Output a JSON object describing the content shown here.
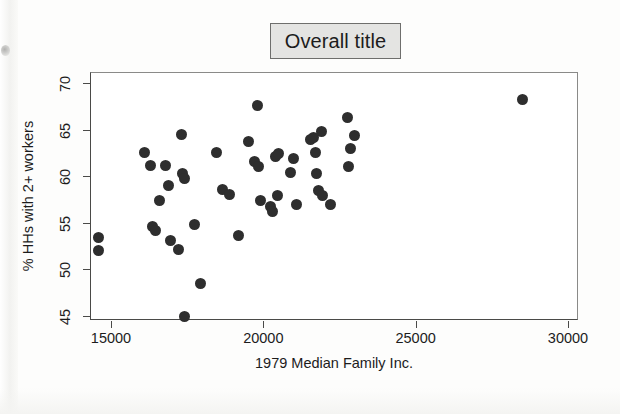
{
  "chart_data": {
    "type": "scatter",
    "title": "Overall title",
    "xlabel": "1979 Median Family Inc.",
    "ylabel": "% HHs with 2+ workers",
    "xlim": [
      14000,
      30400
    ],
    "ylim": [
      44.0,
      70.6
    ],
    "xticks": [
      15000,
      20000,
      25000,
      30000
    ],
    "xtick_labels": [
      "15000",
      "20000",
      "25000",
      "30000"
    ],
    "yticks": [
      45,
      50,
      55,
      60,
      65,
      70
    ],
    "ytick_labels": [
      "45",
      "50",
      "55",
      "60",
      "65",
      "70"
    ],
    "grid": false,
    "legend": null,
    "marker": "filled-circle",
    "marker_color": "#2e2e2e",
    "points": [
      {
        "x": 14600,
        "y": 53.4
      },
      {
        "x": 14600,
        "y": 52.0
      },
      {
        "x": 16100,
        "y": 62.5
      },
      {
        "x": 16300,
        "y": 61.1
      },
      {
        "x": 16350,
        "y": 54.6
      },
      {
        "x": 16450,
        "y": 54.2
      },
      {
        "x": 16600,
        "y": 57.4
      },
      {
        "x": 16800,
        "y": 61.1
      },
      {
        "x": 16900,
        "y": 59.0
      },
      {
        "x": 16950,
        "y": 53.1
      },
      {
        "x": 17200,
        "y": 52.1
      },
      {
        "x": 17300,
        "y": 64.5
      },
      {
        "x": 17350,
        "y": 60.3
      },
      {
        "x": 17400,
        "y": 59.8
      },
      {
        "x": 17400,
        "y": 44.9
      },
      {
        "x": 17750,
        "y": 54.8
      },
      {
        "x": 17950,
        "y": 48.5
      },
      {
        "x": 18450,
        "y": 62.5
      },
      {
        "x": 18650,
        "y": 58.6
      },
      {
        "x": 18900,
        "y": 58.0
      },
      {
        "x": 19200,
        "y": 53.6
      },
      {
        "x": 19500,
        "y": 63.7
      },
      {
        "x": 19700,
        "y": 61.6
      },
      {
        "x": 19800,
        "y": 67.6
      },
      {
        "x": 19850,
        "y": 61.0
      },
      {
        "x": 19900,
        "y": 57.4
      },
      {
        "x": 20250,
        "y": 56.8
      },
      {
        "x": 20300,
        "y": 56.2
      },
      {
        "x": 20400,
        "y": 62.1
      },
      {
        "x": 20450,
        "y": 57.9
      },
      {
        "x": 20500,
        "y": 62.4
      },
      {
        "x": 20900,
        "y": 60.4
      },
      {
        "x": 21000,
        "y": 61.9
      },
      {
        "x": 21100,
        "y": 57.0
      },
      {
        "x": 21550,
        "y": 63.9
      },
      {
        "x": 21650,
        "y": 64.2
      },
      {
        "x": 21700,
        "y": 62.5
      },
      {
        "x": 21750,
        "y": 60.3
      },
      {
        "x": 21800,
        "y": 58.5
      },
      {
        "x": 21900,
        "y": 64.8
      },
      {
        "x": 21950,
        "y": 57.9
      },
      {
        "x": 22200,
        "y": 57.0
      },
      {
        "x": 22750,
        "y": 66.3
      },
      {
        "x": 22800,
        "y": 61.0
      },
      {
        "x": 22850,
        "y": 63.0
      },
      {
        "x": 23000,
        "y": 64.4
      },
      {
        "x": 28500,
        "y": 68.2
      }
    ]
  }
}
